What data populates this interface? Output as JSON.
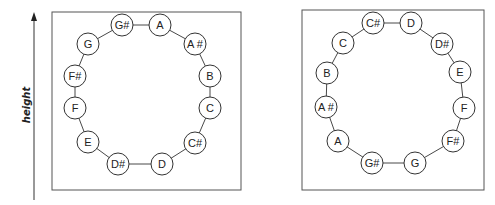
{
  "axis": {
    "label": "height",
    "direction": "up"
  },
  "panels": [
    {
      "name": "left-panel",
      "box": {
        "x": 52,
        "y": 12,
        "w": 189,
        "h": 178
      },
      "notes": [
        {
          "label": "G#",
          "x": 122,
          "y": 25
        },
        {
          "label": "A",
          "x": 160,
          "y": 25
        },
        {
          "label": "A #",
          "x": 195,
          "y": 44
        },
        {
          "label": "B",
          "x": 210,
          "y": 76
        },
        {
          "label": "C",
          "x": 210,
          "y": 108
        },
        {
          "label": "C#",
          "x": 195,
          "y": 143
        },
        {
          "label": "D",
          "x": 162,
          "y": 164
        },
        {
          "label": "D#",
          "x": 118,
          "y": 164
        },
        {
          "label": "E",
          "x": 88,
          "y": 142
        },
        {
          "label": "F",
          "x": 75,
          "y": 108
        },
        {
          "label": "F#",
          "x": 75,
          "y": 76
        },
        {
          "label": "G",
          "x": 88,
          "y": 44
        }
      ]
    },
    {
      "name": "right-panel",
      "box": {
        "x": 302,
        "y": 10,
        "w": 182,
        "h": 180
      },
      "notes": [
        {
          "label": "C#",
          "x": 373,
          "y": 23
        },
        {
          "label": "D",
          "x": 411,
          "y": 23
        },
        {
          "label": "D#",
          "x": 442,
          "y": 44
        },
        {
          "label": "E",
          "x": 460,
          "y": 72
        },
        {
          "label": "F",
          "x": 464,
          "y": 108
        },
        {
          "label": "F#",
          "x": 453,
          "y": 141
        },
        {
          "label": "G",
          "x": 415,
          "y": 163
        },
        {
          "label": "G#",
          "x": 372,
          "y": 163
        },
        {
          "label": "A",
          "x": 338,
          "y": 141
        },
        {
          "label": "A #",
          "x": 326,
          "y": 107
        },
        {
          "label": "B",
          "x": 327,
          "y": 73
        },
        {
          "label": "C",
          "x": 343,
          "y": 43
        }
      ]
    }
  ],
  "style": {
    "stroke": "#333333",
    "box_stroke": "#555555",
    "circle_fill": "#ffffff",
    "circle_radius": 11
  }
}
